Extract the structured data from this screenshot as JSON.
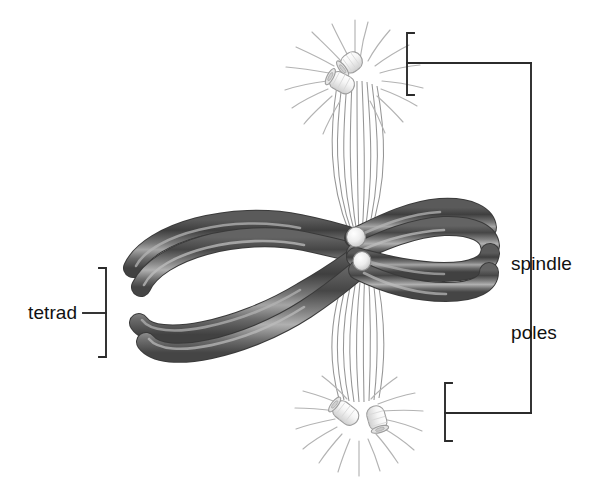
{
  "figure": {
    "name": "meiosis-metaphase-i-tetrad-spindle-diagram",
    "background_color": "#ffffff",
    "line_color": "#2b2b2b"
  },
  "labels": {
    "tetrad": "tetrad",
    "spindle_poles_line1": "spindle",
    "spindle_poles_line2": "poles"
  },
  "structures": {
    "tetrad": {
      "label": "tetrad",
      "chromatid_count": 4,
      "fill_dark": "#4c4c4c",
      "fill_mid": "#6f6f6f",
      "highlight": "#a8a8a8",
      "outline": "#3a3a3a"
    },
    "spindle_poles": {
      "label": "spindle poles",
      "count": 2,
      "centriole_pairs_per_pole": 2,
      "centriole_fill": "#f4f4f4",
      "centriole_outline": "#9a9a9a",
      "aster_ray_color": "#b0b0b0"
    },
    "spindle_fibers": {
      "color": "#8c8c8c",
      "bundle_count": 2
    },
    "centromeres": {
      "count": 2,
      "fill": "#f2f2f2",
      "outline": "#8a8a8a"
    }
  },
  "brackets": {
    "top_pole": {
      "orientation": "left-facing",
      "leader": "horizontal-right"
    },
    "bottom_pole": {
      "orientation": "left-facing",
      "leader": "horizontal-right"
    },
    "tetrad": {
      "orientation": "right-facing",
      "leader": "horizontal-left"
    }
  }
}
